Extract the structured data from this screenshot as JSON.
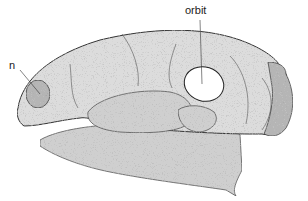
{
  "figure": {
    "labels": {
      "nostril": "n",
      "orbit": "orbit"
    }
  }
}
